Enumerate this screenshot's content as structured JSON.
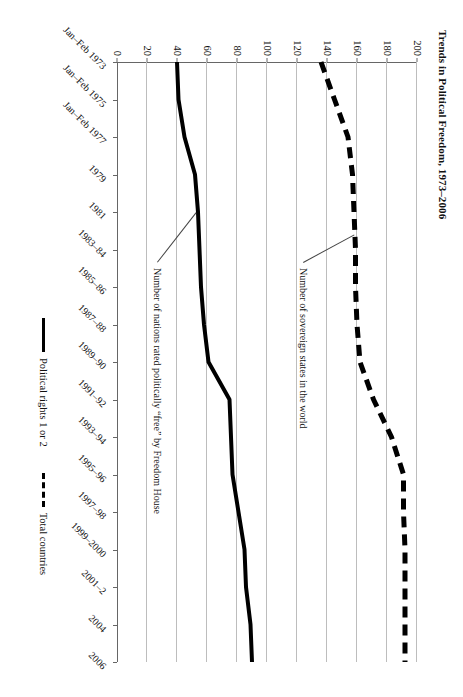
{
  "chart_data": {
    "type": "line",
    "title": "Trends in Political Freedom, 1973–2006",
    "xlabel": "",
    "ylabel": "",
    "ylim": [
      0,
      200
    ],
    "yticks": [
      0,
      20,
      40,
      60,
      80,
      100,
      120,
      140,
      160,
      180,
      200
    ],
    "grid": true,
    "legend_position": "bottom-center",
    "categories": [
      "Jan–Feb 1973",
      "Jan–Feb 1975",
      "Jan–Feb 1977",
      "1979",
      "1981",
      "1983–84",
      "1985–86",
      "1987–88",
      "1989–90",
      "1991–92",
      "1993–94",
      "1995–96",
      "1997–98",
      "1999–2000",
      "2001–2",
      "2004",
      "2006"
    ],
    "series": [
      {
        "name": "Political rights 1 or 2",
        "style": "solid",
        "values": [
          40,
          41,
          45,
          52,
          54,
          55,
          56,
          58,
          61,
          75,
          76,
          77,
          81,
          85,
          86,
          89,
          90
        ]
      },
      {
        "name": "Total countries",
        "style": "dashed",
        "values": [
          136,
          145,
          154,
          157,
          158,
          159,
          159,
          160,
          162,
          171,
          183,
          191,
          191,
          192,
          192,
          192,
          192
        ]
      }
    ],
    "annotations": [
      {
        "id": "annotation-total-countries",
        "text": "Number of sovereign states in the world"
      },
      {
        "id": "annotation-free-nations",
        "text": "Number of nations rated politically “free” by Freedom House"
      }
    ]
  },
  "legend": {
    "items": [
      {
        "label": "Political rights 1 or 2",
        "style": "solid"
      },
      {
        "label": "Total countries",
        "style": "dashed"
      }
    ]
  }
}
